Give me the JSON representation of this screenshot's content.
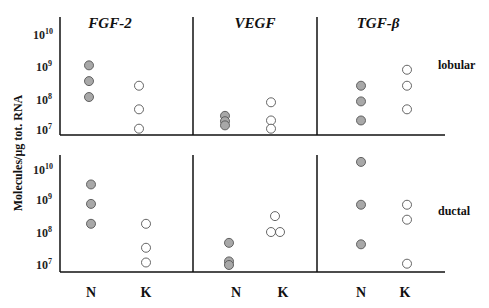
{
  "chart_data": {
    "type": "scatter",
    "ylabel": "Molecules/μg tot. RNA",
    "yscale": "log",
    "ylim": [
      10000000.0,
      10000000000.0
    ],
    "y_ticks": [
      "10^7",
      "10^8",
      "10^9",
      "10^10"
    ],
    "columns": [
      "FGF-2",
      "VEGF",
      "TGF-β"
    ],
    "rows": [
      "lobular",
      "ductal"
    ],
    "x_categories": [
      "N",
      "K"
    ],
    "grid": false,
    "panels": [
      {
        "gene": "FGF-2",
        "type": "lobular",
        "N": [
          1100000000.0,
          350000000.0,
          110000000.0
        ],
        "K": [
          250000000.0,
          45000000.0,
          11000000.0
        ]
      },
      {
        "gene": "VEGF",
        "type": "lobular",
        "N": [
          28000000.0,
          19000000.0,
          14000000.0
        ],
        "K": [
          75000000.0,
          20000000.0,
          11000000.0
        ]
      },
      {
        "gene": "TGF-β",
        "type": "lobular",
        "N": [
          250000000.0,
          80000000.0,
          20000000.0
        ],
        "K": [
          800000000.0,
          250000000.0,
          45000000.0
        ]
      },
      {
        "gene": "FGF-2",
        "type": "ductal",
        "N": [
          3500000000.0,
          850000000.0,
          200000000.0
        ],
        "K": [
          200000000.0,
          35000000.0,
          12000000.0
        ]
      },
      {
        "gene": "VEGF",
        "type": "ductal",
        "N": [
          50000000.0,
          13000000.0,
          10000000.0
        ],
        "K": [
          350000000.0,
          110000000.0,
          110000000.0
        ]
      },
      {
        "gene": "TGF-β",
        "type": "ductal",
        "N": [
          18000000000.0,
          800000000.0,
          45000000.0
        ],
        "K": [
          800000000.0,
          270000000.0,
          11000000.0
        ]
      }
    ]
  },
  "labels": {
    "titles": [
      "FGF-2",
      "VEGF",
      "TGF-β"
    ],
    "rows": [
      "lobular",
      "ductal"
    ],
    "x": [
      "N",
      "K",
      "N",
      "K",
      "N",
      "K"
    ],
    "ylabel": "Molecules/μg tot. RNA",
    "yticks_base": "10",
    "yticks_exp": [
      "10",
      "9",
      "8",
      "7"
    ]
  },
  "colors": {
    "filled": "#a8a8a8",
    "stroke": "#555555",
    "axis": "#111111"
  }
}
